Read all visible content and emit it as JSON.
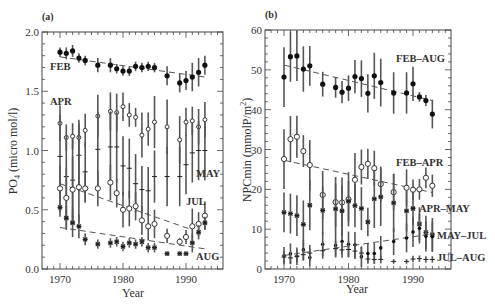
{
  "chart_data": [
    {
      "panel": "(a)",
      "type": "scatter",
      "xlabel": "Year",
      "ylabel": "PO4 (micro mol/l)",
      "ylabel_main": "PO",
      "ylabel_sub": "4",
      "ylabel_rest": " (micro mol/l)",
      "xlim": [
        1967,
        1996
      ],
      "ylim": [
        0.0,
        2.0
      ],
      "xticks": [
        1970,
        1980,
        1990
      ],
      "xtick_labels": [
        "1970",
        "1980",
        "1990"
      ],
      "yticks": [
        0.0,
        0.5,
        1.0,
        1.5,
        2.0
      ],
      "ytick_labels": [
        "0.0",
        "0.5",
        "1.0",
        "1.5",
        "2.0"
      ],
      "grid": false,
      "series": [
        {
          "name": "FEB",
          "marker": "filled-circle",
          "x": [
            1970,
            1971,
            1972,
            1973,
            1974,
            1976,
            1978,
            1979,
            1980,
            1981,
            1982,
            1983,
            1984,
            1985,
            1987,
            1989,
            1990,
            1991,
            1992,
            1993
          ],
          "y": [
            1.83,
            1.82,
            1.84,
            1.78,
            1.76,
            1.72,
            1.72,
            1.69,
            1.67,
            1.67,
            1.71,
            1.7,
            1.71,
            1.7,
            1.63,
            1.57,
            1.59,
            1.62,
            1.66,
            1.72
          ],
          "err": [
            0.04,
            0.05,
            0.05,
            0.04,
            0.04,
            0.06,
            0.06,
            0.04,
            0.04,
            0.04,
            0.04,
            0.04,
            0.04,
            0.04,
            0.08,
            0.08,
            0.08,
            0.12,
            0.12,
            0.08
          ],
          "trend": [
            [
              1970,
              1.79
            ],
            [
              1993,
              1.62
            ]
          ]
        },
        {
          "name": "APR",
          "marker": "open-diamond",
          "x": [
            1970,
            1971,
            1972,
            1973,
            1974,
            1976,
            1978,
            1979,
            1980,
            1981,
            1982,
            1983,
            1984,
            1985,
            1987,
            1989,
            1990,
            1991,
            1992,
            1993
          ],
          "y": [
            1.23,
            1.11,
            1.12,
            1.11,
            1.17,
            1.29,
            1.33,
            1.32,
            1.37,
            1.3,
            1.28,
            1.13,
            1.18,
            1.24,
            1.2,
            1.09,
            1.24,
            1.25,
            1.2,
            1.26
          ],
          "err": [
            0.15,
            0.11,
            0.11,
            0.12,
            0.14,
            0.18,
            0.16,
            0.16,
            0.12,
            0.1,
            0.08,
            0.19,
            0.14,
            0.22,
            0.23,
            0.2,
            0.12,
            0.12,
            0.15,
            0.15
          ]
        },
        {
          "name": "MAY",
          "marker": "plus",
          "x": [
            1970,
            1971,
            1972,
            1973,
            1974,
            1976,
            1978,
            1979,
            1980,
            1981,
            1982,
            1983,
            1984,
            1985,
            1987,
            1989,
            1990,
            1991,
            1992,
            1993
          ],
          "y": [
            0.95,
            0.78,
            0.75,
            0.96,
            0.82,
            1.01,
            1.03,
            1.03,
            0.87,
            0.85,
            0.72,
            0.67,
            0.66,
            0.78,
            0.78,
            0.78,
            0.88,
            0.98,
            1.0,
            1.0
          ],
          "err": [
            0.35,
            0.35,
            0.35,
            0.3,
            0.25,
            0.32,
            0.3,
            0.3,
            0.25,
            0.25,
            0.25,
            0.2,
            0.2,
            0.22,
            0.25,
            0.25,
            0.25,
            0.25,
            0.25,
            0.25
          ]
        },
        {
          "name": "JUL",
          "marker": "open-circle",
          "x": [
            1970,
            1971,
            1972,
            1973,
            1974,
            1976,
            1978,
            1979,
            1980,
            1981,
            1982,
            1983,
            1984,
            1985,
            1987,
            1989,
            1990,
            1991,
            1992,
            1993
          ],
          "y": [
            0.68,
            0.6,
            0.67,
            0.69,
            0.68,
            0.68,
            0.73,
            0.64,
            0.5,
            0.51,
            0.53,
            0.41,
            0.36,
            0.38,
            0.28,
            0.23,
            0.27,
            0.36,
            0.38,
            0.45
          ],
          "err": [
            0.2,
            0.25,
            0.28,
            0.3,
            0.12,
            0.15,
            0.15,
            0.12,
            0.15,
            0.15,
            0.12,
            0.12,
            0.12,
            0.12,
            0.06,
            0.03,
            0.06,
            0.15,
            0.1,
            0.12
          ],
          "trend": [
            [
              1970,
              0.72
            ],
            [
              1991,
              0.33
            ]
          ]
        },
        {
          "name": "AUG",
          "marker": "asterisk",
          "x": [
            1970,
            1971,
            1972,
            1973,
            1974,
            1976,
            1978,
            1979,
            1980,
            1981,
            1982,
            1983,
            1984,
            1985,
            1987,
            1989,
            1990,
            1991,
            1992,
            1993
          ],
          "y": [
            0.52,
            0.43,
            0.39,
            0.36,
            0.25,
            0.21,
            0.22,
            0.23,
            0.19,
            0.22,
            0.21,
            0.23,
            0.18,
            0.18,
            0.13,
            0.13,
            0.13,
            0.22,
            0.31,
            0.39
          ],
          "err": [
            0.08,
            0.1,
            0.12,
            0.1,
            0.05,
            0.04,
            0.04,
            0.04,
            0.04,
            0.04,
            0.04,
            0.04,
            0.04,
            0.04,
            0.02,
            0.02,
            0.02,
            0.08,
            0.06,
            0.05
          ],
          "trend": [
            [
              1970,
              0.35
            ],
            [
              1993,
              0.17
            ]
          ]
        }
      ],
      "annotations": [
        "FEB",
        "APR",
        "MAY",
        "JUL",
        "AUG"
      ]
    },
    {
      "panel": "(b)",
      "type": "scatter",
      "xlabel": "Year",
      "ylabel": "NPCmin (mmolP/m2)",
      "ylabel_main": "NPCmin (mmolP/m",
      "ylabel_sup": "2",
      "ylabel_rest": ")",
      "xlim": [
        1967,
        1996
      ],
      "ylim": [
        0,
        60
      ],
      "xticks": [
        1970,
        1980,
        1990
      ],
      "xtick_labels": [
        "1970",
        "1980",
        "1990"
      ],
      "yticks": [
        0,
        10,
        20,
        30,
        40,
        50,
        60
      ],
      "ytick_labels": [
        "0",
        "10",
        "20",
        "30",
        "40",
        "50",
        "60"
      ],
      "grid": false,
      "series": [
        {
          "name": "FEB-AUG",
          "marker": "filled-circle",
          "x": [
            1970,
            1971,
            1972,
            1973,
            1974,
            1976,
            1978,
            1979,
            1980,
            1981,
            1982,
            1983,
            1984,
            1985,
            1987,
            1989,
            1990,
            1991,
            1992,
            1993
          ],
          "y": [
            48.2,
            53.3,
            53.5,
            50.2,
            51.0,
            46.4,
            45.6,
            44.4,
            45.4,
            48.3,
            47.8,
            44.1,
            48.5,
            46.8,
            44.2,
            44.2,
            46.5,
            43.2,
            42.3,
            38.9
          ],
          "err": [
            7.5,
            6.3,
            6.3,
            5.7,
            5.0,
            3.1,
            2.6,
            2.8,
            3.2,
            4.2,
            4.6,
            4.8,
            5.8,
            6.0,
            5.2,
            5.2,
            4.3,
            1.2,
            1.4,
            3.6
          ],
          "trend": [
            [
              1970,
              51.2
            ],
            [
              1993,
              42.3
            ]
          ]
        },
        {
          "name": "FEB-APR",
          "marker": "open-circle",
          "x": [
            1970,
            1971,
            1972,
            1973,
            1974,
            1976,
            1978,
            1979,
            1980,
            1981,
            1982,
            1983,
            1984,
            1985,
            1987,
            1989,
            1990,
            1991,
            1992,
            1993
          ],
          "y": [
            27.6,
            32.6,
            33.2,
            29.6,
            26.1,
            18.6,
            16.8,
            16.7,
            17.5,
            22.4,
            25.6,
            26.4,
            25.3,
            21.3,
            19.3,
            20.4,
            19.9,
            20.0,
            22.9,
            20.9
          ],
          "err": [
            7.5,
            5.8,
            5.3,
            4.0,
            6.3,
            6.0,
            6.3,
            6.3,
            6.8,
            6.7,
            4.4,
            3.8,
            4.4,
            4.4,
            4.6,
            4.6,
            2.6,
            2.6,
            2.6,
            2.8
          ],
          "trend": [
            [
              1970,
              27.3
            ],
            [
              1993,
              19.2
            ]
          ]
        },
        {
          "name": "APR-MAY",
          "marker": "asterisk",
          "x": [
            1970,
            1971,
            1972,
            1973,
            1974,
            1976,
            1978,
            1979,
            1980,
            1981,
            1982,
            1983,
            1984,
            1985,
            1987,
            1989,
            1990,
            1991,
            1992,
            1993
          ],
          "y": [
            14.2,
            13.9,
            13.4,
            11.2,
            16.0,
            14.7,
            15.1,
            14.6,
            17.0,
            15.9,
            15.2,
            11.8,
            17.6,
            18.1,
            16.6,
            14.6,
            15.2,
            11.3,
            9.2,
            8.6
          ],
          "err": [
            5.0,
            5.0,
            5.1,
            6.0,
            6.3,
            6.0,
            6.3,
            6.3,
            5.1,
            5.4,
            5.4,
            3.6,
            7.3,
            7.3,
            7.3,
            5.2,
            4.2,
            4.2,
            4.2,
            4.2
          ]
        },
        {
          "name": "MAY-JUL",
          "marker": "filled-circle-small",
          "x": [
            1970,
            1971,
            1972,
            1973,
            1974,
            1976,
            1978,
            1979,
            1980,
            1981,
            1982,
            1983,
            1984,
            1985,
            1987,
            1989,
            1990,
            1991,
            1992,
            1993
          ],
          "y": [
            3.3,
            3.8,
            3.2,
            4.8,
            2.9,
            6.2,
            5.9,
            6.9,
            6.2,
            6.1,
            3.1,
            3.9,
            3.9,
            5.3,
            6.9,
            7.8,
            9.3,
            10.2,
            8.2,
            8.1
          ],
          "err": [
            2.2,
            2.6,
            2.2,
            2.6,
            2.2,
            3.0,
            3.0,
            3.2,
            3.2,
            3.2,
            2.6,
            2.6,
            2.6,
            3.0,
            3.4,
            3.6,
            3.8,
            3.8,
            3.8,
            3.8
          ],
          "trend": [
            [
              1970,
              3.4
            ],
            [
              1993,
              8.8
            ]
          ]
        },
        {
          "name": "JUL-AUG",
          "marker": "plus",
          "x": [
            1970,
            1971,
            1972,
            1973,
            1974,
            1976,
            1978,
            1979,
            1980,
            1981,
            1982,
            1983,
            1984,
            1985,
            1987,
            1989,
            1990,
            1991,
            1992,
            1993
          ],
          "y": [
            3.0,
            2.8,
            3.2,
            3.6,
            4.0,
            4.6,
            5.1,
            4.8,
            4.9,
            4.5,
            4.0,
            2.5,
            2.4,
            2.4,
            1.9,
            1.9,
            2.5,
            2.6,
            2.4,
            2.4
          ],
          "err": [
            1.5,
            1.5,
            1.5,
            1.5,
            2.0,
            2.0,
            2.0,
            2.0,
            2.0,
            2.0,
            1.5,
            1.0,
            1.0,
            1.0,
            0.6,
            0.6,
            0.8,
            0.8,
            0.8,
            0.8
          ]
        }
      ],
      "annotations": [
        "FEB-AUG",
        "FEB-APR",
        "APR-MAY",
        "MAY-JUL",
        "JUL-AUG"
      ]
    }
  ],
  "panels": {
    "a": {
      "label": "(a)",
      "xlabel": "Year",
      "ylabel_main": "PO",
      "ylabel_sub": "4",
      "ylabel_rest": " (micro mol/l)",
      "series_labels": {
        "feb": "FEB",
        "apr": "APR",
        "may": "MAY",
        "jul": "JUL",
        "aug": "AUG"
      }
    },
    "b": {
      "label": "(b)",
      "xlabel": "Year",
      "ylabel_main": "NPCmin (mmolP/m",
      "ylabel_sup": "2",
      "ylabel_rest": ")",
      "series_labels": {
        "feb_aug": "FEB–AUG",
        "feb_apr": "FEB–APR",
        "apr_may": "APR–MAY",
        "may_jul": "MAY–JUL",
        "jul_aug": "JUL–AUG"
      }
    }
  },
  "colors": {
    "ink": "#333333",
    "errorbar": "#555555",
    "trend": "#555555"
  }
}
